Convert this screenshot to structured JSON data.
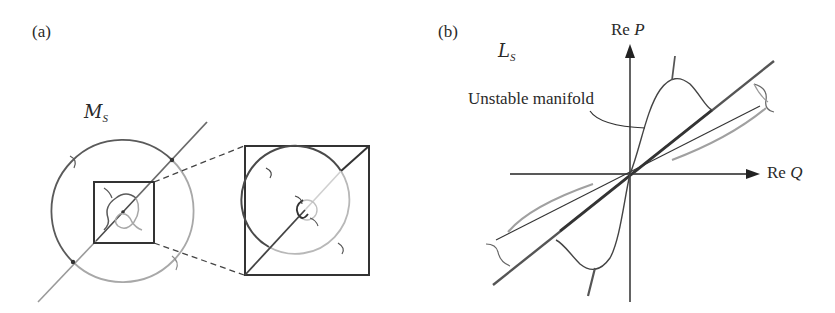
{
  "figure": {
    "panels": [
      {
        "id": "a",
        "label": "(a)",
        "manifold_label": {
          "main": "M",
          "sub": "S"
        },
        "elements": [
          "outer circle",
          "diagonal line",
          "inner square (zoom region)",
          "zoomed square",
          "dashed connector lines",
          "small loop near origin"
        ]
      },
      {
        "id": "b",
        "label": "(b)",
        "manifold_label": {
          "main": "L",
          "sub": "S"
        },
        "axes": {
          "x_label": {
            "prefix": "Re ",
            "var": "Q"
          },
          "y_label": {
            "prefix": "Re ",
            "var": "P"
          }
        },
        "annotation": "Unstable manifold"
      }
    ],
    "colors": {
      "ink_dark": "#3a3a3a",
      "ink_mid": "#6a6a6a",
      "ink_light": "#a8a8a8",
      "ink_faint": "#cfcfcf"
    }
  }
}
